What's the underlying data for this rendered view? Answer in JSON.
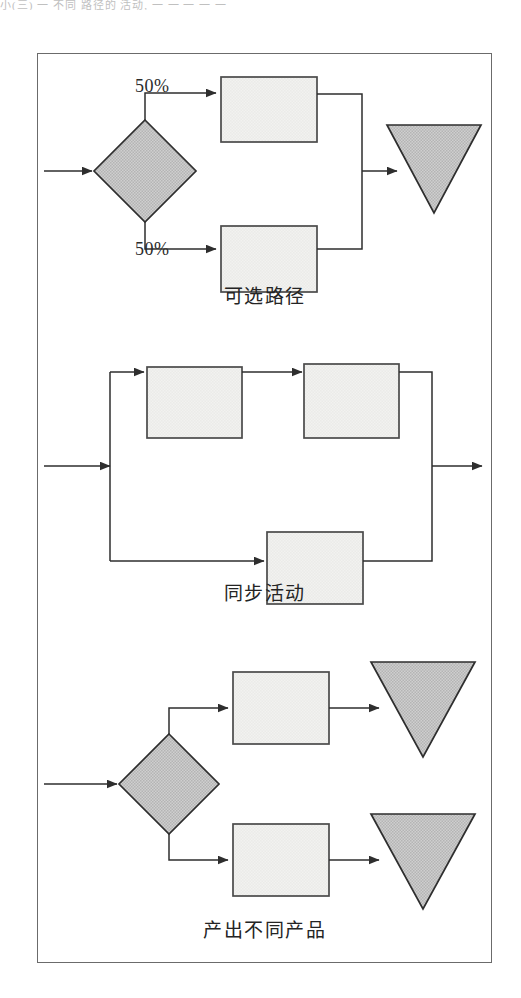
{
  "figure": {
    "scan_artifact_text": "小(三) 一 不同 路径的 活动, 一 一 一 一 一",
    "frame": {
      "x": 37,
      "y": 53,
      "width": 455,
      "height": 910
    },
    "colors": {
      "stroke": "#3a3a3a",
      "frame_stroke": "#6b6b6b",
      "box_fill": "#f1f1ef",
      "diamond_fill": "#c8c8c8",
      "triangle_fill": "#c6c6c6",
      "text": "#242424",
      "page_background": "#ffffff"
    },
    "panels": [
      {
        "id": "panel-alternative-paths",
        "caption": "可选路径",
        "labels": [
          {
            "name": "branch-top-percent",
            "text": "50%"
          },
          {
            "name": "branch-bottom-percent",
            "text": "50%"
          }
        ],
        "shapes": [
          {
            "name": "start-arrow",
            "type": "arrow"
          },
          {
            "name": "decision-diamond",
            "type": "diamond"
          },
          {
            "name": "activity-box-top",
            "type": "box"
          },
          {
            "name": "activity-box-bottom",
            "type": "box"
          },
          {
            "name": "output-triangle",
            "type": "triangle"
          }
        ]
      },
      {
        "id": "panel-synchronized-activities",
        "caption": "同步活动",
        "labels": [],
        "shapes": [
          {
            "name": "start-arrow",
            "type": "arrow"
          },
          {
            "name": "split-junction",
            "type": "junction"
          },
          {
            "name": "activity-box-top-left",
            "type": "box"
          },
          {
            "name": "activity-box-top-right",
            "type": "box"
          },
          {
            "name": "activity-box-bottom",
            "type": "box"
          },
          {
            "name": "merge-junction",
            "type": "junction"
          },
          {
            "name": "end-arrow",
            "type": "arrow"
          }
        ]
      },
      {
        "id": "panel-different-products",
        "caption": "产出不同产品",
        "labels": [],
        "shapes": [
          {
            "name": "start-arrow",
            "type": "arrow"
          },
          {
            "name": "decision-diamond",
            "type": "diamond"
          },
          {
            "name": "activity-box-top",
            "type": "box"
          },
          {
            "name": "activity-box-bottom",
            "type": "box"
          },
          {
            "name": "output-triangle-top",
            "type": "triangle"
          },
          {
            "name": "output-triangle-bottom",
            "type": "triangle"
          }
        ]
      }
    ]
  }
}
